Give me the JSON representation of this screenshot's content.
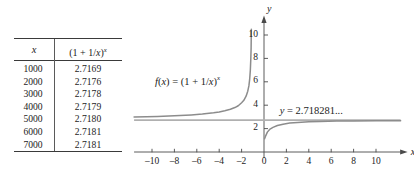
{
  "figure": {
    "table": {
      "columns": [
        "x",
        "(1 + 1/x)^x"
      ],
      "header_x": "x",
      "header_f_open": "(1 + 1/",
      "header_f_var": "x",
      "header_f_close": ")",
      "header_f_exp": "x",
      "rows": [
        {
          "x": "1000",
          "value": "2.7169"
        },
        {
          "x": "2000",
          "value": "2.7176"
        },
        {
          "x": "3000",
          "value": "2.7178"
        },
        {
          "x": "4000",
          "value": "2.7179"
        },
        {
          "x": "5000",
          "value": "2.7180"
        },
        {
          "x": "6000",
          "value": "2.7181"
        },
        {
          "x": "7000",
          "value": "2.7181"
        }
      ]
    },
    "graph": {
      "x_axis_name": "x",
      "y_axis_name": "y",
      "function_label_prefix": "f",
      "function_label_arg": "(x) = (1 + 1/",
      "function_label_var": "x",
      "function_label_close": ")",
      "function_label_exp": "x",
      "asymptote_label_var": "y",
      "asymptote_label_value": " = 2.718281...",
      "x_ticks": [
        "-10",
        "-8",
        "-6",
        "-4",
        "-2",
        "0",
        "2",
        "4",
        "6",
        "8",
        "10"
      ],
      "y_ticks": [
        "2",
        "4",
        "6",
        "8",
        "10"
      ]
    }
  },
  "chart_data": {
    "type": "line",
    "title": "",
    "xlabel": "x",
    "ylabel": "y",
    "xlim": [
      -11.6,
      12.2
    ],
    "ylim": [
      -0.9,
      11.4
    ],
    "grid": false,
    "legend": "none",
    "x_tick_values": [
      -10,
      -8,
      -6,
      -4,
      -2,
      0,
      2,
      4,
      6,
      8,
      10
    ],
    "y_tick_values": [
      2,
      4,
      6,
      8,
      10
    ],
    "annotations": [
      {
        "text": "f(x) = (1 + 1/x)^x",
        "x": -7.0,
        "y": 6.0
      },
      {
        "text": "y = 2.718281...",
        "x": 1.5,
        "y": 3.3
      }
    ],
    "series": [
      {
        "name": "f(x) = (1 + 1/x)^x  (left branch, x < -1)",
        "color": "#8c8c8c",
        "x": [
          -11.6,
          -10.5,
          -9.5,
          -8.5,
          -7.5,
          -6.5,
          -5.5,
          -4.5,
          -4.0,
          -3.5,
          -3.0,
          -2.6,
          -2.3,
          -2.0,
          -1.8,
          -1.6,
          -1.45,
          -1.35,
          -1.28,
          -1.22,
          -1.18,
          -1.15,
          -1.13
        ],
        "y": [
          2.99,
          3.02,
          3.04,
          3.08,
          3.12,
          3.17,
          3.24,
          3.35,
          3.42,
          3.52,
          3.65,
          3.8,
          3.95,
          4.21,
          4.42,
          4.77,
          5.2,
          5.65,
          6.2,
          7.0,
          7.9,
          8.9,
          10.5
        ]
      },
      {
        "name": "f(x) = (1 + 1/x)^x  (right branch, x > 0)",
        "color": "#8c8c8c",
        "x": [
          0.05,
          0.15,
          0.3,
          0.5,
          0.8,
          1.2,
          1.7,
          2.3,
          3.0,
          4.0,
          5.0,
          6.5,
          8.0,
          10.0,
          12.2
        ],
        "y": [
          1.13,
          1.38,
          1.7,
          1.93,
          2.1,
          2.26,
          2.38,
          2.47,
          2.53,
          2.59,
          2.61,
          2.64,
          2.66,
          2.67,
          2.68
        ]
      },
      {
        "name": "y = 2.718281... (horizontal asymptote)",
        "color": "#b0b0b0",
        "x": [
          -11.6,
          12.2
        ],
        "y": [
          2.718281,
          2.718281
        ]
      }
    ]
  }
}
